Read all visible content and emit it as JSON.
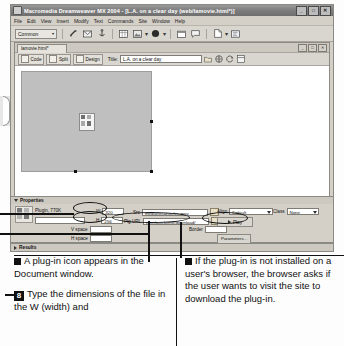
{
  "app": {
    "title_bar": {
      "title": "Macromedia Dreamweaver MX 2004 - [L.A. on a clear day (web/lamovie.html*)]",
      "icon": "dreamweaver-icon",
      "minimize": "_",
      "maximize": "□",
      "close": "✕"
    },
    "menus": [
      "File",
      "Edit",
      "View",
      "Insert",
      "Modify",
      "Text",
      "Commands",
      "Site",
      "Window",
      "Help"
    ],
    "insert_bar": {
      "category": "Common",
      "category_arrow": "▾",
      "icons": [
        "hyperlink-icon",
        "email-link-icon",
        "anchor-icon",
        "table-icon",
        "image-icon",
        "media-icon",
        "date-icon",
        "comment-icon",
        "template-icon",
        "tag-chooser-icon"
      ]
    },
    "document": {
      "tab_label": "lamovie.html*",
      "window_buttons": [
        "_",
        "□",
        "✕"
      ],
      "view_buttons": [
        "Code",
        "Split",
        "Design"
      ],
      "title_label": "Title:",
      "title_value": "L.A. on a clear day",
      "toolbar_icons": [
        "file-management-icon",
        "preview-browser-icon",
        "refresh-design-icon",
        "view-options-icon",
        "validate-markup-icon"
      ]
    },
    "canvas": {
      "plugin_placeholder": "plugin-placeholder",
      "plugin_icon": "plugin-puzzle-icon"
    },
    "status_bar": {
      "tag_selector": "<body> <embed>",
      "window_size": "706 x 296",
      "download_size": "770K / 226 sec"
    }
  },
  "properties": {
    "panel_title": "Properties",
    "expander": "▼",
    "object_icon": "plugin-icon",
    "object_label": "Plugin, 770K",
    "name_value": "",
    "w_label": "W",
    "w_value": "320",
    "h_label": "H",
    "h_value": "256",
    "src_label": "Src",
    "src_value": "media/losangeles.mov",
    "plg_url_label": "Plg URL",
    "plg_url_value": "com/quicktime/download/",
    "align_label": "Align",
    "align_value": "Default",
    "class_label": "Class",
    "class_value": "None",
    "play_label": "Play",
    "vspace_label": "V space",
    "vspace_value": "",
    "hspace_label": "H space",
    "hspace_value": "",
    "border_label": "Border",
    "border_value": "",
    "parameters_label": "Parameters...",
    "folder_icon": "browse-folder-icon"
  },
  "results": {
    "label": "Results",
    "expander": "▶"
  },
  "captions": {
    "left": {
      "note_bullet": "■",
      "note": "A plug-in icon appears in the Document window.",
      "step_number": "8",
      "step_text": "Type the dimensions of the file in the W (width) and"
    },
    "right": {
      "note_bullet": "■",
      "note": "If the plug-in is not installed on a user's browser, the browser asks if the user wants to visit the site to download the plug-in."
    }
  }
}
